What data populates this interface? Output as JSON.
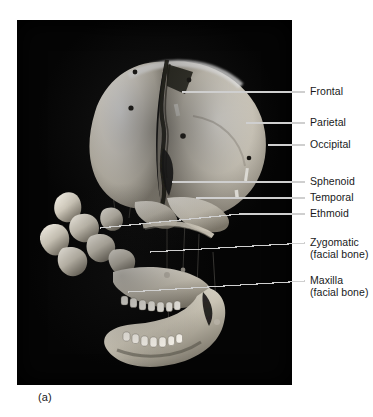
{
  "figure": {
    "caption": "(a)",
    "panel_background": "#050505",
    "label_color": "#18191a",
    "leader_color": "#cfcfcf"
  },
  "labels": [
    {
      "id": "frontal",
      "text": "Frontal",
      "sub": "",
      "y": 92
    },
    {
      "id": "parietal",
      "text": "Parietal",
      "sub": "",
      "y": 123
    },
    {
      "id": "occipital",
      "text": "Occipital",
      "sub": "",
      "y": 145
    },
    {
      "id": "sphenoid",
      "text": "Sphenoid",
      "sub": "",
      "y": 182
    },
    {
      "id": "temporal",
      "text": "Temporal",
      "sub": "",
      "y": 198
    },
    {
      "id": "ethmoid",
      "text": "Ethmoid",
      "sub": "",
      "y": 214
    },
    {
      "id": "zygomatic",
      "text": "Zygomatic",
      "sub": "(facial bone)",
      "y": 243
    },
    {
      "id": "maxilla",
      "text": "Maxilla",
      "sub": "(facial bone)",
      "y": 281
    }
  ],
  "specimen": {
    "description": "Disarticulated human skull, lateral view",
    "bone_highlight": "#f2efe8",
    "bone_midtone": "#cdc7ba",
    "bone_shadow": "#6e685d"
  }
}
